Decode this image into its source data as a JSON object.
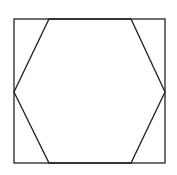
{
  "diagram": {
    "stroke_color": "#222222",
    "background": "#ffffff",
    "square": {
      "x": 14,
      "y": 19,
      "width": 151,
      "height": 144
    },
    "hexagon": {
      "points": [
        [
          49,
          19
        ],
        [
          131,
          19
        ],
        [
          165,
          92
        ],
        [
          131,
          163
        ],
        [
          49,
          163
        ],
        [
          14,
          92
        ]
      ]
    }
  }
}
